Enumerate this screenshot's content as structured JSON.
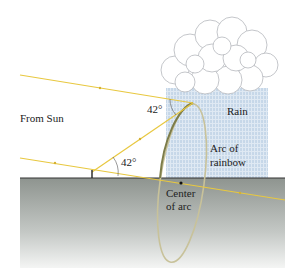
{
  "diagram": {
    "labels": {
      "from_sun": "From Sun",
      "rain": "Rain",
      "angle_top": "42°",
      "angle_bottom": "42°",
      "arc_line1": "Arc of",
      "arc_line2": "rainbow",
      "center_line1": "Center",
      "center_line2": "of arc"
    },
    "colors": {
      "sun_ray": "#e8c840",
      "ground_top": "#8e948f",
      "ground_bottom": "#f4f5f4",
      "rain": "#c5d8ea",
      "arc": "#8a8a58",
      "cloud_stroke": "#b5b8bc"
    }
  }
}
